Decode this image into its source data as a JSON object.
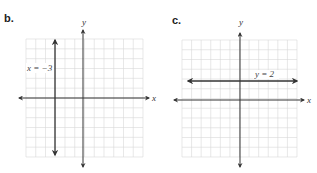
{
  "panels": [
    {
      "label": "b.",
      "x_axis_label": "x",
      "y_axis_label": "y",
      "equation_label": "x = −3"
    },
    {
      "label": "c.",
      "x_axis_label": "x",
      "y_axis_label": "y",
      "equation_label": "y = 2"
    }
  ],
  "colors": {
    "grid": "#d9d9d9",
    "axis": "#333333",
    "line": "#333333"
  },
  "chart_data": [
    {
      "type": "line",
      "title": "b.",
      "xlabel": "x",
      "ylabel": "y",
      "xlim": [
        -6,
        6
      ],
      "ylim": [
        -6,
        6
      ],
      "grid": true,
      "series": [
        {
          "name": "x = −3",
          "kind": "vertical",
          "x": -3
        }
      ],
      "annotations": [
        "x = −3"
      ]
    },
    {
      "type": "line",
      "title": "c.",
      "xlabel": "x",
      "ylabel": "y",
      "xlim": [
        -6,
        6
      ],
      "ylim": [
        -6,
        6
      ],
      "grid": true,
      "series": [
        {
          "name": "y = 2",
          "kind": "horizontal",
          "y": 2
        }
      ],
      "annotations": [
        "y = 2"
      ]
    }
  ]
}
